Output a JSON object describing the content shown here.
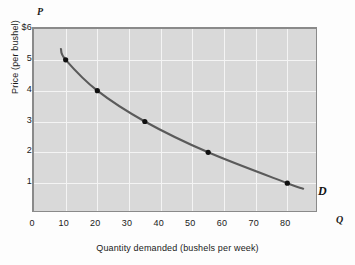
{
  "chart_data": {
    "type": "line",
    "title": "",
    "xlabel": "Quantity demanded (bushels per week)",
    "ylabel": "Price (per bushel)",
    "x_axis_symbol": "Q",
    "y_axis_symbol": "P",
    "series_label": "D",
    "xlim": [
      0,
      90
    ],
    "ylim": [
      0,
      6
    ],
    "grid": true,
    "legend_position": "inline-right",
    "xticks": [
      {
        "value": 0,
        "label": "0"
      },
      {
        "value": 10,
        "label": "10"
      },
      {
        "value": 20,
        "label": "20"
      },
      {
        "value": 30,
        "label": "30"
      },
      {
        "value": 40,
        "label": "40"
      },
      {
        "value": 50,
        "label": "50"
      },
      {
        "value": 60,
        "label": "60"
      },
      {
        "value": 70,
        "label": "70"
      },
      {
        "value": 80,
        "label": "80"
      }
    ],
    "yticks": [
      {
        "value": 6,
        "label": "$6"
      },
      {
        "value": 5,
        "label": "5"
      },
      {
        "value": 4,
        "label": "4"
      },
      {
        "value": 3,
        "label": "3"
      },
      {
        "value": 2,
        "label": "2"
      },
      {
        "value": 1,
        "label": "1"
      }
    ],
    "points": [
      {
        "q": 10,
        "p": 5
      },
      {
        "q": 20,
        "p": 4
      },
      {
        "q": 35,
        "p": 3
      },
      {
        "q": 55,
        "p": 2
      },
      {
        "q": 80,
        "p": 1
      }
    ],
    "curve_extent": {
      "q_start": 8.5,
      "p_start": 5.35,
      "q_end": 85,
      "p_end": 0.82
    },
    "colors": {
      "plot_background": "#d9d9d9",
      "gridline": "#f4f4f4",
      "curve": "#5a5a5a",
      "point": "#101010",
      "border": "#8a8a8a",
      "text": "#1a1a1a"
    }
  }
}
